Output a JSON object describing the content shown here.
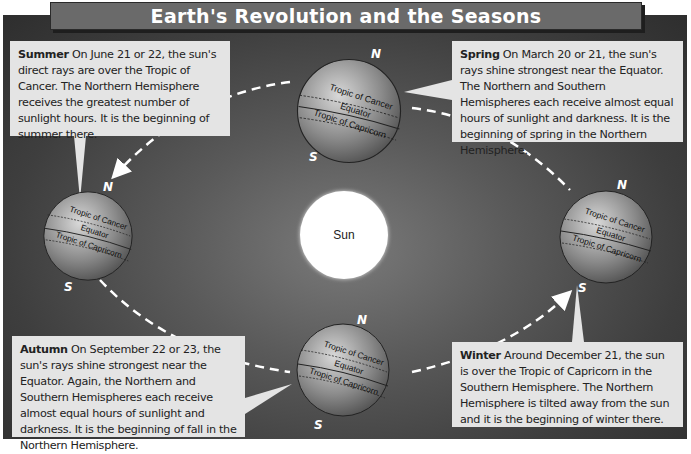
{
  "title": "Earth's Revolution and the Seasons",
  "sun": {
    "label": "Sun"
  },
  "seasons": {
    "summer": {
      "heading": "Summer",
      "text": "On June 21 or 22, the sun's direct rays are over the Tropic of Cancer. The Northern Hemisphere receives the greatest number of sunlight hours. It is the beginning of summer there."
    },
    "spring": {
      "heading": "Spring",
      "text": "On March 20 or 21, the sun's rays shine strongest near the Equator. The Northern and Southern Hemispheres each receive almost equal hours of sunlight and darkness. It is the beginning of spring in the Northern Hemisphere."
    },
    "autumn": {
      "heading": "Autumn",
      "text": "On September 22 or 23, the sun's rays shine strongest near the Equator. Again, the Northern and Southern Hemispheres each receive almost equal hours of sunlight and darkness. It is the beginning of fall in the Northern Hemisphere."
    },
    "winter": {
      "heading": "Winter",
      "text": "Around December 21, the sun is over the Tropic of Capricorn in the Southern Hemisphere. The Northern Hemisphere is tilted away from the sun and it is the beginning of winter there."
    }
  },
  "globe_labels": {
    "north": "N",
    "south": "S",
    "tropic_cancer": "Tropic of Cancer",
    "equator": "Equator",
    "tropic_capricorn": "Tropic of Capricorn"
  },
  "colors": {
    "background": "#4a4a4a",
    "title_bar": "#6a6a6a",
    "box_fill": "#e4e4e4",
    "sun": "#ffffff",
    "orbit": "#ffffff"
  }
}
